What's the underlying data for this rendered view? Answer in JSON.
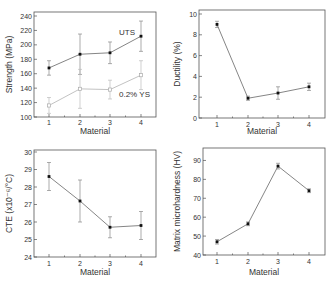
{
  "chart_data": [
    {
      "type": "line",
      "title": "",
      "xlabel": "Material",
      "ylabel": "Strength (MPa)",
      "categories": [
        "1",
        "2",
        "3",
        "4"
      ],
      "ylim": [
        100,
        240
      ],
      "yticks": [
        100,
        120,
        140,
        160,
        180,
        200,
        220,
        240
      ],
      "grid": false,
      "series": [
        {
          "name": "UTS",
          "values": [
            168,
            187,
            189,
            212
          ],
          "err": [
            10,
            28,
            15,
            21
          ],
          "marker": "filled-square"
        },
        {
          "name": "0.2% YS",
          "values": [
            116,
            139,
            138,
            158
          ],
          "err": [
            11,
            27,
            13,
            20
          ],
          "marker": "open"
        }
      ],
      "annotations": [
        "UTS",
        "0.2% YS"
      ]
    },
    {
      "type": "line",
      "title": "",
      "xlabel": "Material",
      "ylabel": "Ductility (%)",
      "categories": [
        "1",
        "2",
        "3",
        "4"
      ],
      "ylim": [
        0,
        10
      ],
      "yticks": [
        0,
        2,
        4,
        6,
        8,
        10
      ],
      "grid": false,
      "series": [
        {
          "name": "Ductility",
          "values": [
            9.0,
            1.9,
            2.4,
            3.0
          ],
          "err": [
            0.3,
            0.2,
            0.6,
            0.35
          ]
        }
      ]
    },
    {
      "type": "line",
      "title": "",
      "xlabel": "Material",
      "ylabel": "CTE (x10⁻⁶/°C)",
      "categories": [
        "1",
        "2",
        "3",
        "4"
      ],
      "ylim": [
        24,
        30
      ],
      "yticks": [
        24,
        25,
        26,
        27,
        28,
        29,
        30
      ],
      "grid": false,
      "series": [
        {
          "name": "CTE",
          "values": [
            28.6,
            27.2,
            25.7,
            25.8
          ],
          "err": [
            0.8,
            1.2,
            0.6,
            0.8
          ]
        }
      ]
    },
    {
      "type": "line",
      "title": "",
      "xlabel": "Material",
      "ylabel": "Matrix microhardness (HV)",
      "categories": [
        "1",
        "2",
        "3",
        "4"
      ],
      "ylim": [
        40,
        95
      ],
      "yticks": [
        40,
        50,
        60,
        70,
        80,
        90
      ],
      "grid": false,
      "series": [
        {
          "name": "Microhardness",
          "values": [
            47,
            56.5,
            87,
            74
          ],
          "err": [
            1.2,
            1.0,
            1.5,
            1.0
          ]
        }
      ]
    }
  ]
}
